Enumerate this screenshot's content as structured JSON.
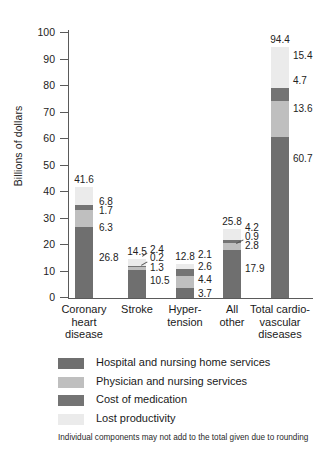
{
  "chart_data": {
    "type": "bar",
    "subtype": "stacked-bar",
    "title": "",
    "xlabel": "",
    "ylabel": "Billions of dollars",
    "ylim": [
      0,
      100
    ],
    "ytick_step": 10,
    "yticks": [
      "100",
      "90",
      "80",
      "70",
      "60",
      "50",
      "40",
      "30",
      "20",
      "10",
      "0"
    ],
    "grid": false,
    "legend_position": "below",
    "categories": [
      "Coronary heart disease",
      "Stroke",
      "Hypertension",
      "All other",
      "Total cardiovascular diseases"
    ],
    "category_label_lines": [
      [
        "Coronary",
        "heart",
        "disease"
      ],
      [
        "Stroke"
      ],
      [
        "Hyper-",
        "tension"
      ],
      [
        "All",
        "other"
      ],
      [
        "Total cardio-",
        "vascular",
        "diseases"
      ]
    ],
    "series": [
      {
        "name": "Hospital and nursing home services",
        "color": "#6f6f6f",
        "values": [
          26.8,
          10.5,
          3.7,
          17.9,
          60.7
        ]
      },
      {
        "name": "Physician and nursing services",
        "color": "#bfbfbf",
        "values": [
          6.3,
          1.3,
          4.4,
          2.8,
          13.6
        ]
      },
      {
        "name": "Cost of medication",
        "color": "#747474",
        "values": [
          1.7,
          0.2,
          2.6,
          0.9,
          4.7
        ]
      },
      {
        "name": "Lost productivity",
        "color": "#ebebeb",
        "values": [
          6.8,
          2.4,
          2.1,
          4.2,
          15.4
        ]
      }
    ],
    "totals": [
      41.6,
      14.5,
      12.8,
      25.8,
      94.4
    ],
    "total_labels": [
      "41.6",
      "14.5",
      "12.8",
      "25.8",
      "94.4"
    ],
    "segment_labels": [
      [
        "26.8",
        "6.3",
        "1.7",
        "6.8"
      ],
      [
        "10.5",
        "1.3",
        "0.2",
        "2.4"
      ],
      [
        "3.7",
        "4.4",
        "2.6",
        "2.1"
      ],
      [
        "17.9",
        "2.8",
        "0.9",
        "4.2"
      ],
      [
        "60.7",
        "13.6",
        "4.7",
        "15.4"
      ]
    ],
    "annotation": "Individual components may not add to the total given due to rounding"
  },
  "legend": {
    "items": [
      {
        "label": "Hospital and nursing home services",
        "color": "#6f6f6f"
      },
      {
        "label": "Physician and nursing services",
        "color": "#bfbfbf"
      },
      {
        "label": "Cost of medication",
        "color": "#747474"
      },
      {
        "label": "Lost productivity",
        "color": "#ebebeb"
      }
    ]
  },
  "footnote": "Individual components may not add to the total given due to rounding"
}
